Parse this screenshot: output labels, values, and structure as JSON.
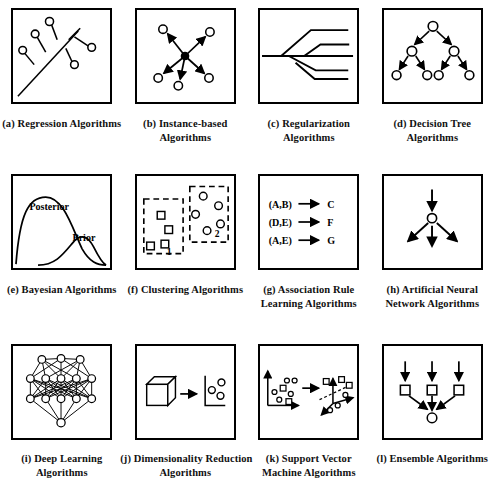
{
  "figure": {
    "background": "#ffffff",
    "stroke": "#000000",
    "panel_border": "#000000"
  },
  "panels": [
    {
      "id": "regression",
      "letter": "(a)",
      "caption_lines": [
        "(a) Regression Algorithms"
      ],
      "icon": "regression-line-with-residuals"
    },
    {
      "id": "instance-based",
      "letter": "(b)",
      "caption_lines": [
        "(b) Instance-based",
        "Algorithms"
      ],
      "icon": "radiating-arrows-from-center-node"
    },
    {
      "id": "regularization",
      "letter": "(c)",
      "caption_lines": [
        "(c) Regularization",
        "Algorithms"
      ],
      "icon": "branching-shrinkage-paths"
    },
    {
      "id": "decision-tree",
      "letter": "(d)",
      "caption_lines": [
        "(d) Decision Tree",
        "Algorithms"
      ],
      "icon": "binary-tree-with-arrows"
    },
    {
      "id": "bayesian",
      "letter": "(e)",
      "caption_lines": [
        "(e) Bayesian Algorithms"
      ],
      "icon": "prior-posterior-curves",
      "labels": {
        "posterior": "Posterior",
        "prior": "Prior"
      }
    },
    {
      "id": "clustering",
      "letter": "(f)",
      "caption_lines": [
        "(f) Clustering Algorithms"
      ],
      "icon": "two-dashed-clusters",
      "labels": {
        "cluster_one": "1",
        "cluster_two": "2"
      }
    },
    {
      "id": "association-rule",
      "letter": "(g)",
      "caption_lines": [
        "(g) Association Rule",
        "Learning Algorithms"
      ],
      "icon": "implication-rules",
      "rules": [
        {
          "antecedent": "(A,B)",
          "consequent": "C"
        },
        {
          "antecedent": "(D,E)",
          "consequent": "F"
        },
        {
          "antecedent": "(A,E)",
          "consequent": "G"
        }
      ]
    },
    {
      "id": "artificial-neural-network",
      "letter": "(h)",
      "caption_lines": [
        "(h) Artificial Neural",
        "Network Algorithms"
      ],
      "icon": "single-neuron-fan-out"
    },
    {
      "id": "deep-learning",
      "letter": "(i)",
      "caption_lines": [
        "(i) Deep Learning",
        "Algorithms"
      ],
      "icon": "dense-multilayer-network"
    },
    {
      "id": "dimensionality-reduction",
      "letter": "(j)",
      "caption_lines": [
        "(j) Dimensionality Reduction",
        "Algorithms"
      ],
      "icon": "cube-to-2d-plot"
    },
    {
      "id": "support-vector-machine",
      "letter": "(k)",
      "caption_lines": [
        "(k) Support Vector",
        "Machine Algorithms"
      ],
      "icon": "2d-scatter-to-3d-hyperplane"
    },
    {
      "id": "ensemble",
      "letter": "(l)",
      "caption_lines": [
        "(l) Ensemble Algorithms"
      ],
      "icon": "three-models-combined"
    }
  ]
}
